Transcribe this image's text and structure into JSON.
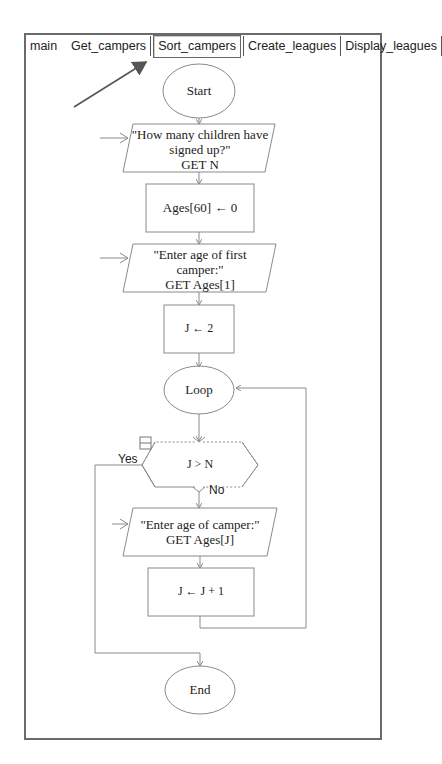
{
  "tabs": [
    {
      "label": "main",
      "selected": false
    },
    {
      "label": "Get_campers",
      "selected": false
    },
    {
      "label": "Sort_campers",
      "selected": true
    },
    {
      "label": "Create_leagues",
      "selected": false
    },
    {
      "label": "Display_leagues",
      "selected": false
    }
  ],
  "flowchart": {
    "start": "Start",
    "input1": "\"How many children have\nsigned up?\"\nGET N",
    "assign1": "Ages[60] ← 0",
    "input2": "\"Enter age of first\ncamper:\"\nGET Ages[1]",
    "assign2": "J ← 2",
    "loop": "Loop",
    "condition": "J > N",
    "yes_label": "Yes",
    "no_label": "No",
    "input3": "\"Enter age of camper:\"\nGET Ages[J]",
    "assign3": "J ← J + 1",
    "end": "End"
  },
  "colors": {
    "line": "#8a8a8a",
    "frame": "#6b6b6b",
    "text": "#222222"
  }
}
